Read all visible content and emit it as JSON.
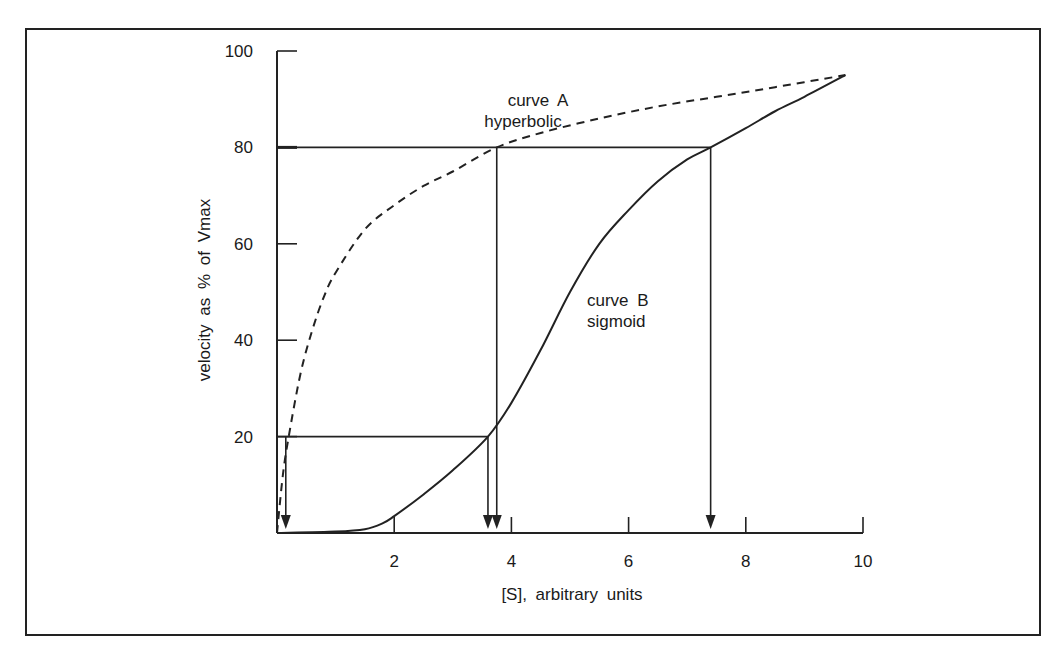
{
  "chart_data": {
    "type": "line",
    "title": "",
    "xlabel": "[S], arbitrary units",
    "ylabel": "velocity as % of Vmax",
    "xlim": [
      0,
      10
    ],
    "ylim": [
      0,
      100
    ],
    "xticks": [
      2,
      4,
      6,
      8,
      10
    ],
    "yticks": [
      20,
      40,
      60,
      80,
      100
    ],
    "grid": false,
    "series": [
      {
        "name": "curve A hyperbolic",
        "label_line1": "curve A",
        "label_line2": "hyperbolic",
        "style": "dashed",
        "x": [
          0,
          0.1,
          0.2,
          0.4,
          0.6,
          0.8,
          1.0,
          1.5,
          2.0,
          2.5,
          3.0,
          3.75,
          4.5,
          5.5,
          6.5,
          7.5,
          8.5,
          9.7
        ],
        "y": [
          0,
          12,
          20,
          33,
          42,
          49,
          54,
          63,
          68,
          72,
          75,
          80,
          83,
          86,
          88.5,
          90.5,
          92.5,
          95
        ]
      },
      {
        "name": "curve B sigmoid",
        "label_line1": "curve B",
        "label_line2": "sigmoid",
        "style": "solid",
        "x": [
          0,
          1.0,
          1.5,
          1.8,
          2.0,
          2.5,
          3.0,
          3.6,
          4.0,
          4.5,
          5.0,
          5.5,
          6.0,
          6.5,
          7.0,
          7.4,
          8.0,
          8.5,
          9.0,
          9.7
        ],
        "y": [
          0,
          0.3,
          0.8,
          2,
          3.5,
          8,
          13,
          20,
          27,
          38,
          50,
          60,
          67,
          73,
          77.5,
          80,
          84,
          87.5,
          90.5,
          95
        ]
      }
    ],
    "annotations": [
      {
        "type": "hline",
        "y": 80,
        "x_from": 0,
        "x_to": 7.4
      },
      {
        "type": "hline",
        "y": 20,
        "x_from": 0,
        "x_to": 3.6
      },
      {
        "type": "arrow-down",
        "x": 0.15,
        "y_from": 20,
        "label": "curve A at 20%"
      },
      {
        "type": "arrow-down",
        "x": 3.6,
        "y_from": 20,
        "label": "curve B at 20%"
      },
      {
        "type": "arrow-down",
        "x": 3.75,
        "y_from": 80,
        "label": "curve A at 80%"
      },
      {
        "type": "arrow-down",
        "x": 7.4,
        "y_from": 80,
        "label": "curve B at 80%"
      }
    ],
    "text_labels": {
      "curve_a": {
        "x": 3.5,
        "y": 87
      },
      "curve_b": {
        "x": 5.5,
        "y": 47
      }
    }
  },
  "axis": {
    "x_title": "[S], arbitrary units",
    "y_title": "velocity as % of Vmax"
  }
}
